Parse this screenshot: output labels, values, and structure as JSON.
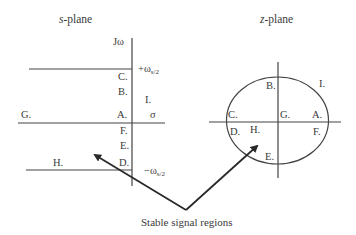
{
  "s_plane": {
    "title_var": "s",
    "title_rest": "-plane",
    "imag_axis_label": "Jω",
    "real_axis_label": "σ",
    "upper_limit_main": "+ω",
    "upper_limit_sub": "s/2",
    "lower_limit_main": "−ω",
    "lower_limit_sub": "s/2",
    "points": {
      "A": "A.",
      "B": "B.",
      "C": "C.",
      "D": "D.",
      "E": "E.",
      "F": "F.",
      "G": "G.",
      "H": "H.",
      "I": "I."
    }
  },
  "z_plane": {
    "title_var": "z",
    "title_rest": "-plane",
    "points": {
      "A": "A.",
      "B": "B.",
      "C": "C.",
      "D": "D.",
      "E": "E.",
      "F": "F.",
      "G": "G.",
      "H": "H.",
      "I": "I."
    }
  },
  "caption": "Stable signal regions",
  "colors": {
    "line": "#444444",
    "arrow": "#2a2a2a",
    "text": "#3a3a3a"
  }
}
